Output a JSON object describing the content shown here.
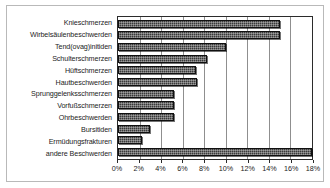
{
  "chart_data": {
    "type": "bar",
    "orientation": "horizontal",
    "title": "",
    "subtitle": "",
    "xlabel": "",
    "ylabel": "",
    "xlim": [
      0,
      18
    ],
    "xunit": "%",
    "xticks": [
      0,
      2,
      4,
      6,
      8,
      10,
      12,
      14,
      16,
      18
    ],
    "xtick_labels": [
      "0%",
      "2%",
      "4%",
      "6%",
      "8%",
      "10%",
      "12%",
      "14%",
      "16%",
      "18%"
    ],
    "grid": true,
    "grid_axis": "x",
    "legend": false,
    "legend_position": "none",
    "bar_color": "#3a3a3a",
    "bar_pattern": "dark-dither",
    "categories": [
      "Knieschmerzen",
      "Wirbelsäulenbeschwerden",
      "Tend(ovag)initiden",
      "Schulterschmerzen",
      "Hüftschmerzen",
      "Hautbeschwerden",
      "Sprunggelenksschmerzen",
      "Vorfußschmerzen",
      "Ohrbeschwerden",
      "Bursitiden",
      "Ermüdungsfrakturen",
      "andere Beschwerden"
    ],
    "values": [
      15.0,
      15.0,
      10.0,
      8.3,
      7.2,
      7.3,
      5.2,
      5.2,
      5.2,
      3.0,
      2.2,
      18.0
    ]
  }
}
